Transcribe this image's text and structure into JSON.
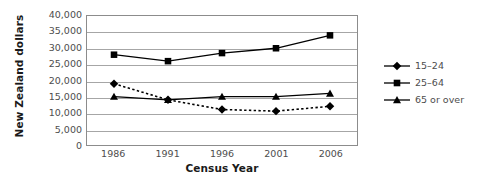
{
  "chart_data": {
    "type": "line",
    "title": "",
    "xlabel": "Census Year",
    "ylabel": "New Zealand dollars",
    "categories": [
      "1986",
      "1991",
      "1996",
      "2001",
      "2006"
    ],
    "ylim": [
      0,
      40000
    ],
    "ytick_labels": [
      "40,000",
      "35,000",
      "30,000",
      "25,000",
      "20,000",
      "15,000",
      "10,000",
      "5,000",
      "0"
    ],
    "ytick_values": [
      40000,
      35000,
      30000,
      25000,
      20000,
      15000,
      10000,
      5000,
      0
    ],
    "grid": true,
    "legend_position": "right",
    "series": [
      {
        "name": "15–24",
        "marker": "diamond",
        "line_style": "dotted",
        "color": "#000000",
        "values": [
          19000,
          14000,
          11000,
          10500,
          12000
        ]
      },
      {
        "name": "25–64",
        "marker": "square",
        "line_style": "solid",
        "color": "#000000",
        "values": [
          28000,
          26000,
          28500,
          30000,
          34000
        ]
      },
      {
        "name": "65 or over",
        "marker": "triangle",
        "line_style": "solid",
        "color": "#000000",
        "values": [
          15000,
          14000,
          15000,
          15000,
          16000
        ]
      }
    ]
  },
  "axes": {
    "y_title": "New Zealand dollars",
    "x_title": "Census Year"
  },
  "legend": {
    "items": [
      {
        "label": "15–24"
      },
      {
        "label": "25–64"
      },
      {
        "label": "65 or over"
      }
    ]
  },
  "colors": {
    "ink": "#000000",
    "axis_text": "#4d4d4d",
    "title_text": "#1a1a1a",
    "gridline": "#a6a6a6",
    "plot_border": "#8c8c8c",
    "background": "#ffffff"
  }
}
